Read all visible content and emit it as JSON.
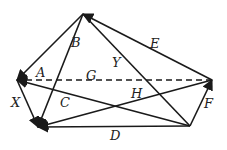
{
  "diagram": {
    "points": {
      "P": [
        83,
        14
      ],
      "L": [
        17,
        80
      ],
      "BL": [
        38,
        127
      ],
      "R": [
        212,
        80
      ],
      "BR": [
        190,
        126
      ]
    },
    "vectors": [
      {
        "label": "A",
        "from": "P",
        "to": "L",
        "arrow": true,
        "dashed": false,
        "label_pos": [
          36,
          77
        ]
      },
      {
        "label": "B",
        "from": "P",
        "to": "BL",
        "arrow": true,
        "dashed": false,
        "label_pos": [
          71,
          47
        ]
      },
      {
        "label": "E",
        "from": "R",
        "to": "P",
        "arrow": true,
        "dashed": false,
        "label_pos": [
          150,
          48
        ]
      },
      {
        "label": "Y",
        "from": "P",
        "to": "BR",
        "arrow": false,
        "dashed": false,
        "label_pos": [
          112,
          67
        ]
      },
      {
        "label": "G",
        "from": "R",
        "to": "L",
        "arrow": true,
        "dashed": true,
        "label_pos": [
          86,
          80
        ]
      },
      {
        "label": "X",
        "from": "L",
        "to": "BL",
        "arrow": true,
        "dashed": false,
        "label_pos": [
          11,
          107
        ]
      },
      {
        "label": "C",
        "from": "BR",
        "to": "L",
        "arrow": true,
        "dashed": false,
        "label_pos": [
          60,
          107
        ]
      },
      {
        "label": "H",
        "from": "R",
        "to": "BL",
        "arrow": true,
        "dashed": false,
        "label_pos": [
          131,
          98
        ]
      },
      {
        "label": "D",
        "from": "BR",
        "to": "BL",
        "arrow": true,
        "dashed": false,
        "label_pos": [
          110,
          140
        ]
      },
      {
        "label": "F",
        "from": "BR",
        "to": "R",
        "arrow": true,
        "dashed": false,
        "label_pos": [
          204,
          108
        ]
      }
    ],
    "stroke_color": "#1a1a1a"
  }
}
